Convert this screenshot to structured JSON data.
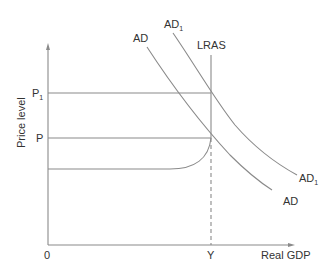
{
  "diagram": {
    "type": "AD-AS model",
    "axes": {
      "y_label": "Price level",
      "x_label": "Real GDP",
      "origin_label": "0"
    },
    "price_levels": [
      {
        "label": "P",
        "subscript": "1"
      },
      {
        "label": "P",
        "subscript": ""
      }
    ],
    "output_label": "Y",
    "curves": {
      "lras": {
        "label": "LRAS"
      },
      "ad": {
        "label": "AD",
        "subscript": ""
      },
      "ad1": {
        "label": "AD",
        "subscript": "1"
      }
    }
  }
}
